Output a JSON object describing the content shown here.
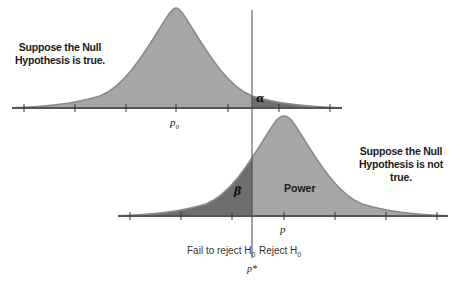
{
  "diagram": {
    "top_distribution": {
      "caption_line1": "Suppose the Null",
      "caption_line2": "Hypothesis is true.",
      "center_label": "p",
      "center_sub": "0",
      "tail_label": "α",
      "fill_color": "#a6a6a6",
      "tail_color": "#6e6e6e"
    },
    "bottom_distribution": {
      "caption_line1": "Suppose the Null",
      "caption_line2": "Hypothesis is not true.",
      "center_label": "p",
      "left_label": "β",
      "right_label": "Power",
      "fill_color": "#a6a6a6",
      "left_color": "#6e6e6e"
    },
    "critical_value": {
      "label": "p*",
      "left_region": "Fail to reject H",
      "left_region_sub": "0",
      "divider": "|",
      "right_region": "Reject H",
      "right_region_sub": "0"
    }
  }
}
